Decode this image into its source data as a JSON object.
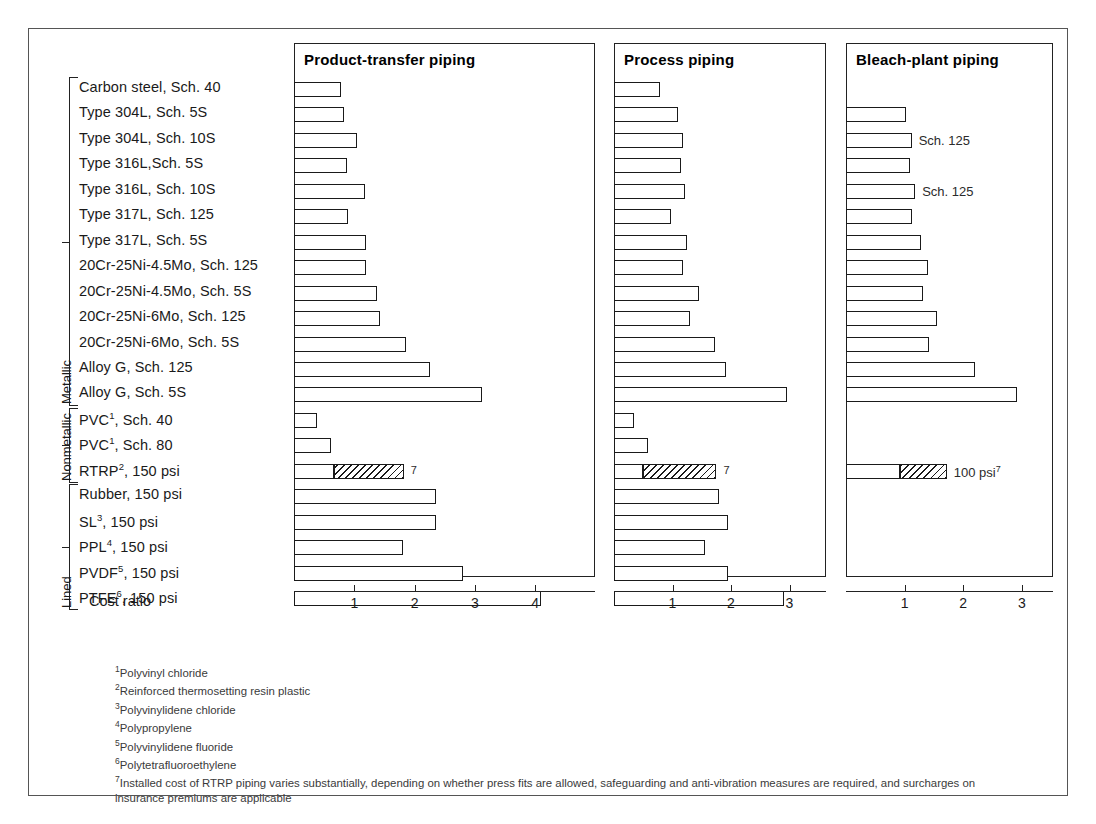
{
  "figure": {
    "axis_title": "Cost ratio"
  },
  "groups": [
    {
      "name": "Metallic",
      "label": "Metallic"
    },
    {
      "name": "Nonmetallic",
      "label": "Nonmetallic"
    },
    {
      "name": "Lined",
      "label": "Lined"
    }
  ],
  "panels": [
    {
      "key": "product_transfer",
      "title": "Product-transfer piping"
    },
    {
      "key": "process",
      "title": "Process piping"
    },
    {
      "key": "bleach_plant",
      "title": "Bleach-plant piping"
    }
  ],
  "bar_notes": {
    "rtrp_product_transfer": "7",
    "rtrp_process": "7",
    "rtrp_bleach_plant": "100 psi",
    "rtrp_bleach_plant_sup": "7",
    "bleach_304l_5s": "",
    "bleach_304l_10s": "Sch. 125",
    "bleach_316l_5s": "",
    "bleach_316l_10s": "Sch. 125"
  },
  "footnotes": [
    {
      "sup": "1",
      "text": "Polyvinyl chloride"
    },
    {
      "sup": "2",
      "text": "Reinforced thermosetting resin plastic"
    },
    {
      "sup": "3",
      "text": "Polyvinylidene chloride"
    },
    {
      "sup": "4",
      "text": "Polypropylene"
    },
    {
      "sup": "5",
      "text": "Polyvinylidene fluoride"
    },
    {
      "sup": "6",
      "text": "Polytetrafluoroethylene"
    },
    {
      "sup": "7",
      "text": "Installed cost of RTRP piping varies substantially, depending on whether press fits are allowed, safeguarding and anti-vibration measures are required, and surcharges on insurance premiums are applicable"
    }
  ],
  "chart_data": {
    "type": "bar",
    "title": "",
    "xlabel": "Cost ratio",
    "ylabel": "",
    "orientation": "horizontal",
    "grid": false,
    "legend": "none",
    "categories": [
      "Carbon steel, Sch. 40",
      "Type 304L, Sch. 5S",
      "Type 304L, Sch. 10S",
      "Type 316L,Sch. 5S",
      "Type 316L, Sch. 10S",
      "Type 317L, Sch. 125",
      "Type 317L, Sch. 5S",
      "20Cr-25Ni-4.5Mo, Sch. 125",
      "20Cr-25Ni-4.5Mo, Sch. 5S",
      "20Cr-25Ni-6Mo, Sch. 125",
      "20Cr-25Ni-6Mo, Sch. 5S",
      "Alloy G, Sch. 125",
      "Alloy G, Sch. 5S",
      "PVC<sup>1</sup>, Sch. 40",
      "PVC<sup>1</sup>, Sch. 80",
      "RTRP<sup>2</sup>, 150 psi",
      "Rubber, 150 psi",
      "SL<sup>3</sup>, 150 psi",
      "PPL<sup>4</sup>, 150 psi",
      "PVDF<sup>5</sup>, 150 psi",
      "PTFE<sup>6</sup>, 150 psi"
    ],
    "category_groups": [
      {
        "label": "Metallic",
        "from": 0,
        "to": 12
      },
      {
        "label": "Nonmetallic",
        "from": 13,
        "to": 15
      },
      {
        "label": "Lined",
        "from": 16,
        "to": 20
      }
    ],
    "series": [
      {
        "name": "Product-transfer piping",
        "xlim": [
          0,
          4.6
        ],
        "xticks": [
          1,
          2,
          3,
          4
        ],
        "values": [
          0.78,
          0.83,
          1.05,
          0.88,
          1.18,
          0.9,
          1.2,
          1.2,
          1.38,
          1.42,
          1.85,
          2.25,
          3.12,
          0.38,
          0.62,
          1.82,
          2.35,
          2.35,
          1.8,
          2.8,
          4.1
        ]
      },
      {
        "name": "Process piping",
        "xlim": [
          0,
          3.5
        ],
        "xticks": [
          1,
          2,
          3
        ],
        "values": [
          0.78,
          1.1,
          1.18,
          1.15,
          1.22,
          0.98,
          1.25,
          1.18,
          1.45,
          1.3,
          1.72,
          1.92,
          2.95,
          0.35,
          0.58,
          1.75,
          1.8,
          1.95,
          1.55,
          1.95,
          2.9
        ]
      },
      {
        "name": "Bleach-plant piping",
        "xlim": [
          0,
          3.5
        ],
        "xticks": [
          1,
          2,
          3
        ],
        "values": [
          null,
          1.02,
          1.12,
          1.1,
          1.18,
          1.12,
          1.28,
          1.4,
          1.32,
          1.55,
          1.42,
          2.2,
          2.92,
          null,
          null,
          1.72,
          null,
          null,
          null,
          null,
          null
        ]
      }
    ],
    "stacked_segments": {
      "note": "RTRP bars are split: a plain (open) lower segment and a hatched upper segment",
      "Product-transfer piping": {
        "category": "RTRP<sup>2</sup>, 150 psi",
        "plain_end": 0.66,
        "hatched_end": 1.82
      },
      "Process piping": {
        "category": "RTRP<sup>2</sup>, 150 psi",
        "plain_end": 0.5,
        "hatched_end": 1.75
      },
      "Bleach-plant piping": {
        "category": "RTRP<sup>2</sup>, 150 psi",
        "plain_end": 0.92,
        "hatched_end": 1.72
      }
    }
  }
}
